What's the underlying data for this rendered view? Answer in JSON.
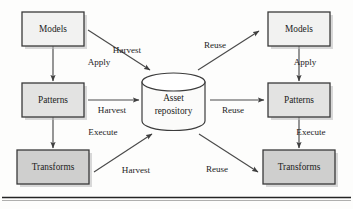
{
  "diagram": {
    "background_color": "#fdfdfc",
    "nodes": [
      {
        "id": "models_left",
        "label": "Models",
        "shape": "rect",
        "fill": "#f2f2f1",
        "x": 22,
        "y": 12,
        "w": 62,
        "h": 34
      },
      {
        "id": "patterns_left",
        "label": "Patterns",
        "shape": "rect",
        "fill": "#e3e3e2",
        "x": 22,
        "y": 83,
        "w": 62,
        "h": 34
      },
      {
        "id": "transforms_left",
        "label": "Transforms",
        "shape": "rect",
        "fill": "#cfcfce",
        "x": 17,
        "y": 150,
        "w": 72,
        "h": 34
      },
      {
        "id": "asset_repository",
        "label": "Asset repository",
        "shape": "cylinder",
        "fill": "#fbfbfa",
        "x": 142,
        "y": 73,
        "w": 63,
        "h": 57
      },
      {
        "id": "models_right",
        "label": "Models",
        "shape": "rect",
        "fill": "#f2f2f1",
        "x": 268,
        "y": 12,
        "w": 62,
        "h": 34
      },
      {
        "id": "patterns_right",
        "label": "Patterns",
        "shape": "rect",
        "fill": "#e3e3e2",
        "x": 268,
        "y": 83,
        "w": 62,
        "h": 34
      },
      {
        "id": "transforms_right",
        "label": "Transforms",
        "shape": "rect",
        "fill": "#cfcfce",
        "x": 263,
        "y": 150,
        "w": 72,
        "h": 34
      }
    ],
    "edges": [
      {
        "id": "apply_left",
        "label": "Apply",
        "from": "models_left",
        "to": "patterns_left",
        "kind": "vertical"
      },
      {
        "id": "execute_left",
        "label": "Execute",
        "from": "patterns_left",
        "to": "transforms_left",
        "kind": "vertical"
      },
      {
        "id": "harvest_models",
        "label": "Harvest",
        "from": "models_left",
        "to": "asset_repository",
        "kind": "diagonal"
      },
      {
        "id": "harvest_patterns",
        "label": "Harvest",
        "from": "patterns_left",
        "to": "asset_repository",
        "kind": "horizontal"
      },
      {
        "id": "harvest_transf",
        "label": "Harvest",
        "from": "transforms_left",
        "to": "asset_repository",
        "kind": "diagonal"
      },
      {
        "id": "reuse_models",
        "label": "Reuse",
        "from": "asset_repository",
        "to": "models_right",
        "kind": "diagonal"
      },
      {
        "id": "reuse_patterns",
        "label": "Reuse",
        "from": "asset_repository",
        "to": "patterns_right",
        "kind": "horizontal"
      },
      {
        "id": "reuse_transf",
        "label": "Reuse",
        "from": "asset_repository",
        "to": "transforms_right",
        "kind": "diagonal"
      },
      {
        "id": "apply_right",
        "label": "Apply",
        "from": "models_right",
        "to": "patterns_right",
        "kind": "vertical"
      },
      {
        "id": "execute_right",
        "label": "Execute",
        "from": "patterns_right",
        "to": "transforms_right",
        "kind": "vertical"
      }
    ],
    "edge_label_positions": {
      "apply_left": {
        "x": 99,
        "y": 63
      },
      "execute_left": {
        "x": 103,
        "y": 133
      },
      "harvest_models": {
        "x": 127,
        "y": 51
      },
      "harvest_patterns": {
        "x": 112,
        "y": 111
      },
      "harvest_transf": {
        "x": 136,
        "y": 171
      },
      "reuse_models": {
        "x": 215,
        "y": 46
      },
      "reuse_patterns": {
        "x": 233,
        "y": 111
      },
      "reuse_transf": {
        "x": 217,
        "y": 170
      },
      "apply_right": {
        "x": 305,
        "y": 63
      },
      "execute_right": {
        "x": 311,
        "y": 133
      }
    },
    "footer_rule": {
      "y": 198,
      "color": "#242424"
    }
  }
}
